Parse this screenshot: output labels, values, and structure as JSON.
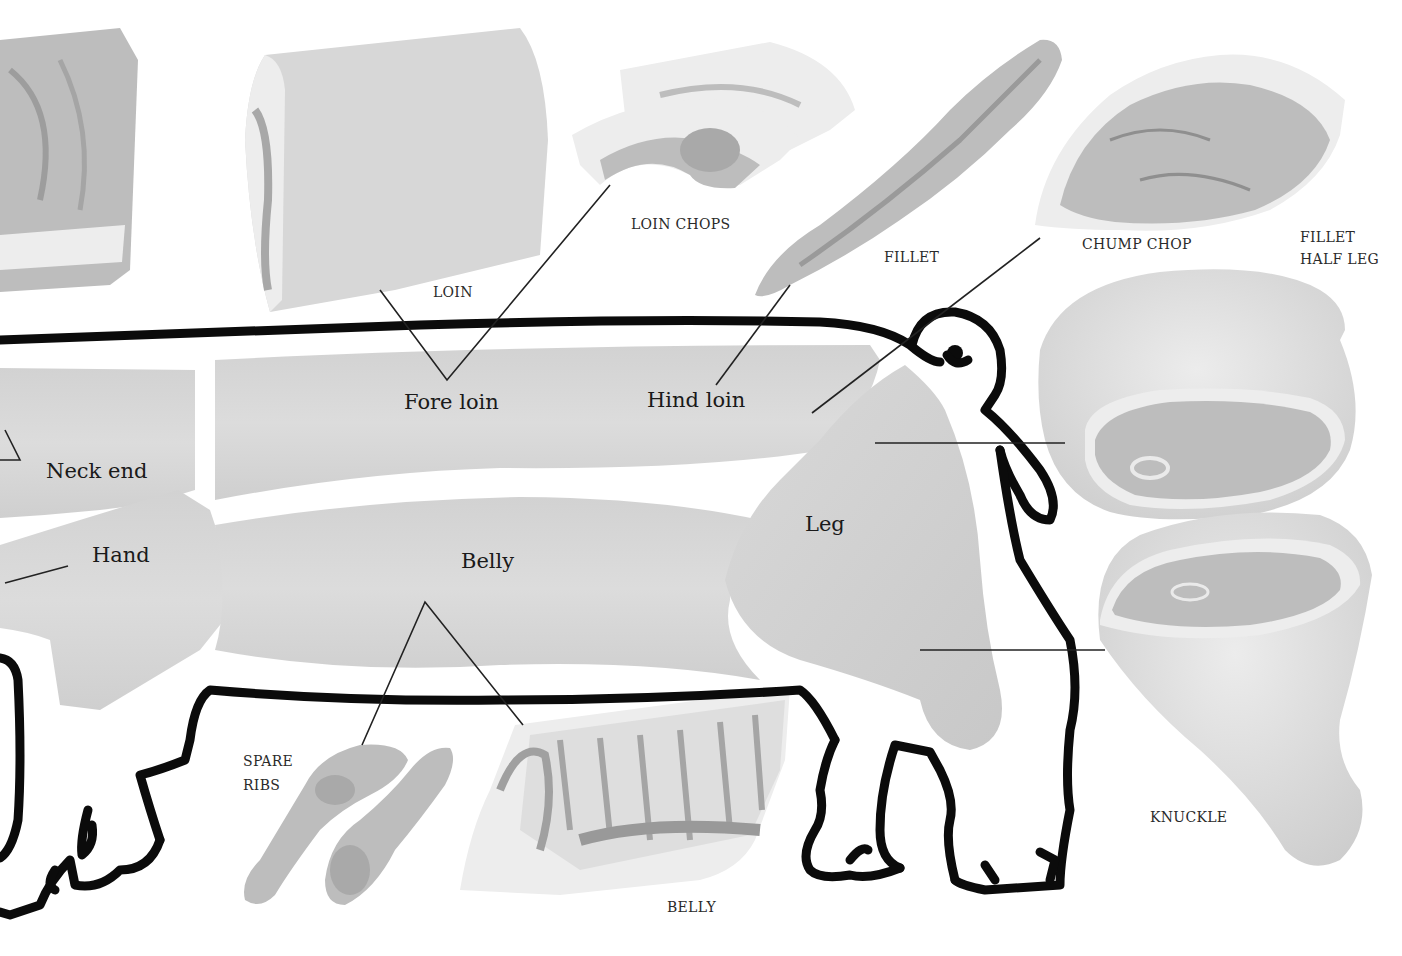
{
  "diagram": {
    "regions": [
      {
        "id": "neck-end",
        "label": "Neck end"
      },
      {
        "id": "hand",
        "label": "Hand"
      },
      {
        "id": "fore-loin",
        "label": "Fore loin"
      },
      {
        "id": "hind-loin",
        "label": "Hind loin"
      },
      {
        "id": "belly",
        "label": "Belly"
      },
      {
        "id": "leg",
        "label": "Leg"
      }
    ],
    "cuts": [
      {
        "id": "loin",
        "label": "LOIN"
      },
      {
        "id": "loin-chops",
        "label": "LOIN CHOPS"
      },
      {
        "id": "fillet",
        "label": "FILLET"
      },
      {
        "id": "chump-chop",
        "label": "CHUMP CHOP"
      },
      {
        "id": "fillet-half-leg",
        "label_line1": "FILLET",
        "label_line2": "HALF LEG"
      },
      {
        "id": "knuckle",
        "label": "KNUCKLE"
      },
      {
        "id": "spare-ribs",
        "label_line1": "SPARE",
        "label_line2": "RIBS"
      },
      {
        "id": "belly-cut",
        "label": "BELLY"
      }
    ],
    "colors": {
      "outline": "#0b0b0b",
      "block": "#d7d7d7",
      "meat": "#bdbdbd",
      "fat": "#ededed",
      "background": "#ffffff"
    }
  }
}
